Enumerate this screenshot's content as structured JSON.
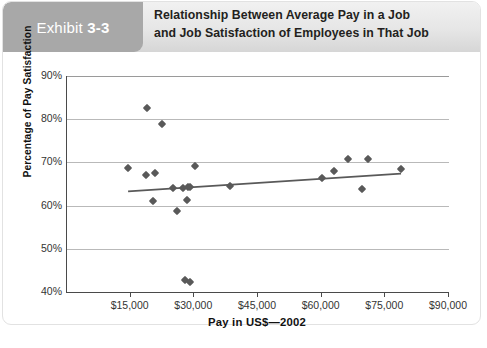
{
  "exhibit": {
    "word": "Exhibit",
    "number": "3-3"
  },
  "title": {
    "line1": "Relationship Between Average Pay in a Job",
    "line2": "and Job Satisfaction of Employees in That Job"
  },
  "colors": {
    "exhibit_tab": "#a8a8a8",
    "header_band": "#e6e6e6",
    "point": "#595959",
    "trendline": "#595959",
    "gridline": "#b9b9b9",
    "axis": "#4a4a4a"
  },
  "chart_data": {
    "type": "scatter",
    "title": "Relationship Between Average Pay in a Job and Job Satisfaction of Employees in That Job",
    "xlabel": "Pay in US$—2002",
    "ylabel": "Percentage of Pay Satisfaction",
    "xlim": [
      0,
      90000
    ],
    "ylim": [
      40,
      90
    ],
    "xticks": [
      0,
      15000,
      30000,
      45000,
      60000,
      75000,
      90000
    ],
    "xticklabels": [
      "",
      "$15,000",
      "$30,000",
      "$45,000",
      "$60,000",
      "$75,000",
      "$90,000"
    ],
    "yticks": [
      40,
      50,
      60,
      70,
      80,
      90
    ],
    "yticklabels": [
      "40%",
      "50%",
      "60%",
      "70%",
      "80%",
      "90%"
    ],
    "grid": "horizontal",
    "legend": "none",
    "points": [
      {
        "x": 18900,
        "y": 82.6
      },
      {
        "x": 22300,
        "y": 79.0
      },
      {
        "x": 14300,
        "y": 68.6
      },
      {
        "x": 18500,
        "y": 67.0
      },
      {
        "x": 20800,
        "y": 67.6
      },
      {
        "x": 30200,
        "y": 69.2
      },
      {
        "x": 24900,
        "y": 64.1
      },
      {
        "x": 27400,
        "y": 64.0
      },
      {
        "x": 28500,
        "y": 64.2
      },
      {
        "x": 29000,
        "y": 64.2
      },
      {
        "x": 38400,
        "y": 64.5
      },
      {
        "x": 20200,
        "y": 61.0
      },
      {
        "x": 25900,
        "y": 58.7
      },
      {
        "x": 28200,
        "y": 61.2
      },
      {
        "x": 27700,
        "y": 42.8
      },
      {
        "x": 29000,
        "y": 42.2
      },
      {
        "x": 60100,
        "y": 66.3
      },
      {
        "x": 63000,
        "y": 68.0
      },
      {
        "x": 66200,
        "y": 70.7
      },
      {
        "x": 70800,
        "y": 70.7
      },
      {
        "x": 69600,
        "y": 63.8
      },
      {
        "x": 78600,
        "y": 68.5
      }
    ],
    "trendline": {
      "x_start": 14400,
      "y_start": 63.3,
      "x_end": 78700,
      "y_end": 67.4
    }
  },
  "axes": {
    "y_ticks": [
      {
        "label": "90%",
        "value": 90
      },
      {
        "label": "80%",
        "value": 80
      },
      {
        "label": "70%",
        "value": 70
      },
      {
        "label": "60%",
        "value": 60
      },
      {
        "label": "50%",
        "value": 50
      },
      {
        "label": "40%",
        "value": 40
      }
    ],
    "x_ticks": [
      {
        "label": "$15,000",
        "value": 15000
      },
      {
        "label": "$30,000",
        "value": 30000
      },
      {
        "label": "$45,000",
        "value": 45000
      },
      {
        "label": "$60,000",
        "value": 60000
      },
      {
        "label": "$75,000",
        "value": 75000
      },
      {
        "label": "$90,000",
        "value": 90000
      }
    ]
  }
}
